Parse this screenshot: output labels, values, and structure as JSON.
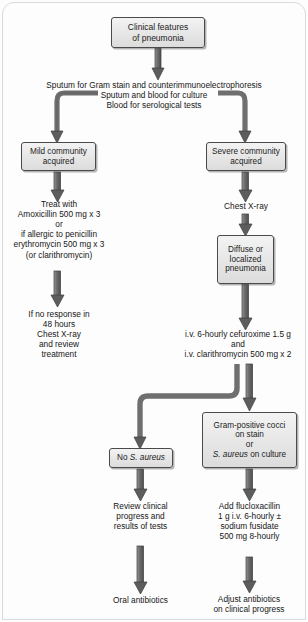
{
  "diagram": {
    "type": "clinical-algorithm-flowchart",
    "colors": {
      "box_fill_light": "#f3f3f3",
      "box_fill_dark": "#dcdcdc",
      "box_border": "#4a4a4a",
      "arrow_fill": "#6e6e6e",
      "arrow_stroke": "#3c3c3c",
      "text": "#161616",
      "page_background": "#fdfdfd"
    },
    "nodes": {
      "clinical_features": {
        "lines": [
          "Clinical features",
          "of pneumonia"
        ]
      },
      "mild_community": {
        "lines": [
          "Mild community",
          "acquired"
        ]
      },
      "severe_community": {
        "lines": [
          "Severe community",
          "acquired"
        ]
      },
      "diffuse_localized": {
        "lines": [
          "Diffuse or",
          "localized",
          "pneumonia"
        ]
      },
      "no_s_aureus": {
        "lines": [
          "No ",
          "S. aureus"
        ]
      },
      "no_s_aureus_plain": "No ",
      "no_s_aureus_italic": "S. aureus",
      "gram_positive": {
        "line1": "Gram-positive cocci",
        "line2": "on stain",
        "line3": "or",
        "line4_italic": "S. aureus",
        "line4_rest": " on culture"
      }
    },
    "labels": {
      "investigations": [
        "Sputum for Gram stain and counterimmunoelectrophoresis",
        "Sputum and blood for culture",
        "Blood for serological tests"
      ],
      "mild_treatment": [
        "Treat with",
        "Amoxicillin 500 mg x 3",
        "or",
        "if allergic to penicillin",
        "erythromycin 500 mg x 3",
        "(or clarithromycin)"
      ],
      "mild_no_response": [
        "If no response in",
        "48 hours",
        "Chest X-ray",
        "and review",
        "treatment"
      ],
      "chest_xray": [
        "Chest X-ray"
      ],
      "iv_therapy": [
        "i.v. 6-hourly cefuroxime 1.5 g",
        "and",
        "i.v. clarithromycin 500 mg x 2"
      ],
      "review_clinical": [
        "Review clinical",
        "progress and",
        "results of tests"
      ],
      "oral_antibiotics": [
        "Oral antibiotics"
      ],
      "add_flucloxacillin": [
        "Add flucloxacillin",
        "1 g i.v. 6-hourly ±",
        "sodium fusidate",
        "500 mg 8-hourly"
      ],
      "adjust_antibiotics": [
        "Adjust antibiotics",
        "on clinical progress"
      ]
    }
  }
}
